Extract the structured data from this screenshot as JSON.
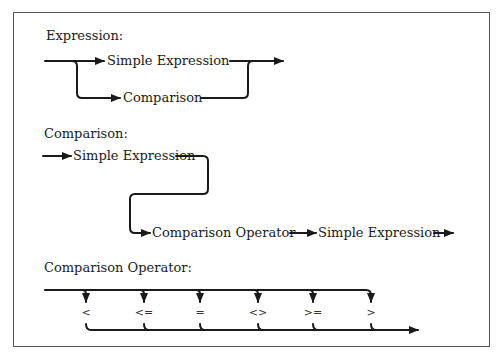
{
  "sections": {
    "expression": {
      "title": "Expression:",
      "nodes": [
        "Simple Expression",
        "Comparison"
      ]
    },
    "comparison": {
      "title": "Comparison:",
      "nodes": [
        "Simple Expression",
        "Comparison Operator",
        "Simple Expression"
      ]
    },
    "comparison_operator": {
      "title": "Comparison Operator:",
      "operators": [
        "<",
        "<=",
        "=",
        "<>",
        ">=",
        ">"
      ]
    }
  },
  "colors": {
    "line": "#1a1a1a",
    "frame": "#555555",
    "background": "#ffffff"
  }
}
